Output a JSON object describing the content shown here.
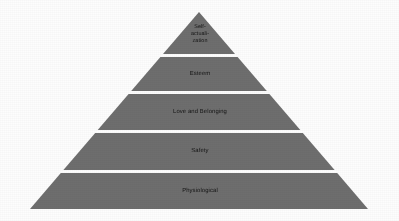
{
  "figure": {
    "kind": "pyramid-diagram",
    "background_color": "#fdfdfd",
    "tier_fill_color": "#6e6e6e",
    "tier_gap_color": "#ffffff",
    "text_color": "#141414",
    "apex": {
      "x": 199,
      "y": 12
    },
    "base_left": {
      "x": 30,
      "y": 209
    },
    "base_right": {
      "x": 370,
      "y": 209
    }
  },
  "tiers": [
    {
      "id": "self-actualization",
      "label": "Self-\nactuali-\nzation",
      "level": 5,
      "top_y": 12,
      "bottom_y": 54,
      "half_width_top": 0,
      "half_width_bottom": 36
    },
    {
      "id": "esteem",
      "label": "Esteem",
      "level": 4,
      "top_y": 57,
      "bottom_y": 91,
      "half_width_top": 38.6,
      "half_width_bottom": 67.8
    },
    {
      "id": "love-and-belonging",
      "label": "Love and Belonging",
      "level": 3,
      "top_y": 94,
      "bottom_y": 130,
      "half_width_top": 70.4,
      "half_width_bottom": 101.3
    },
    {
      "id": "safety",
      "label": "Safety",
      "level": 2,
      "top_y": 133,
      "bottom_y": 170,
      "half_width_top": 103.8,
      "half_width_bottom": 135.6
    },
    {
      "id": "physiological",
      "label": "Physiological",
      "level": 1,
      "top_y": 173,
      "bottom_y": 209,
      "half_width_top": 138.2,
      "half_width_bottom": 169
    }
  ]
}
